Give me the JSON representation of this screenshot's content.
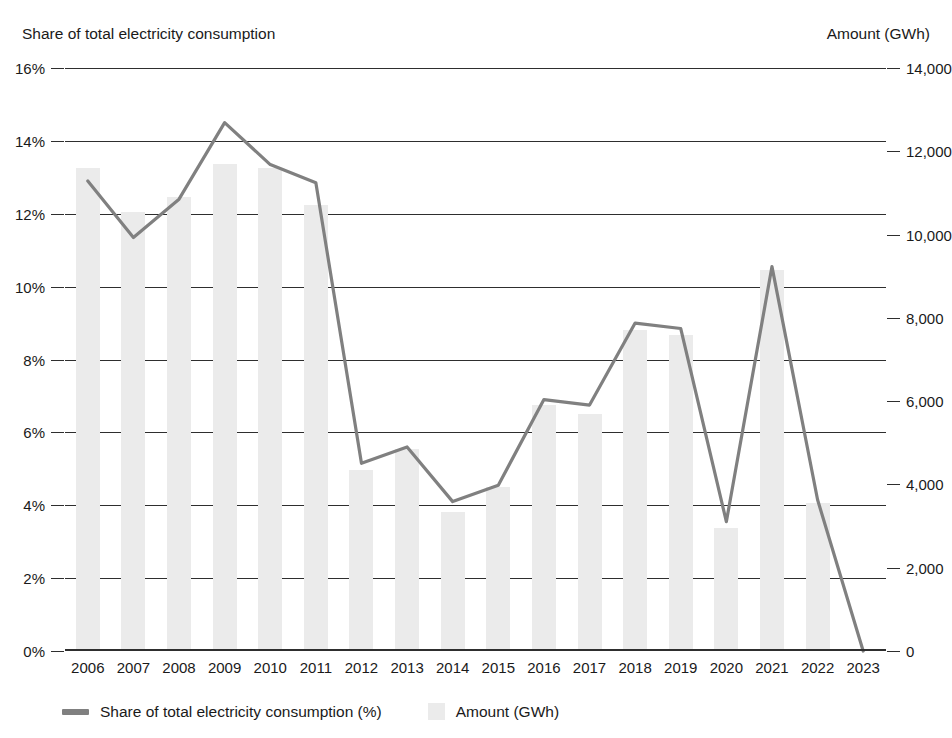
{
  "chart_data": {
    "type": "bar",
    "title": "",
    "subtitle": "",
    "categories": [
      "2006",
      "2007",
      "2008",
      "2009",
      "2010",
      "2011",
      "2012",
      "2013",
      "2014",
      "2015",
      "2016",
      "2017",
      "2018",
      "2019",
      "2020",
      "2021",
      "2022",
      "2023"
    ],
    "series": [
      {
        "name": "Amount (GWh)",
        "type": "bar",
        "axis": "right",
        "color": "#ebebeb",
        "values": [
          11600,
          10550,
          10900,
          11700,
          11600,
          10700,
          4350,
          4850,
          3350,
          3950,
          5900,
          5700,
          7700,
          7600,
          2950,
          9150,
          3550,
          0
        ]
      },
      {
        "name": "Share of total electricity consumption (%)",
        "type": "line",
        "axis": "left",
        "color": "#808080",
        "values": [
          12.9,
          11.35,
          12.4,
          14.5,
          13.35,
          12.85,
          5.15,
          5.6,
          4.1,
          4.55,
          6.9,
          6.75,
          9.0,
          8.85,
          3.55,
          10.55,
          4.15,
          0.0
        ]
      }
    ],
    "left_axis": {
      "label": "Share of total electricity consumption",
      "ticks": [
        "0%",
        "2%",
        "4%",
        "6%",
        "8%",
        "10%",
        "12%",
        "14%",
        "16%"
      ],
      "tick_values": [
        0,
        2,
        4,
        6,
        8,
        10,
        12,
        14,
        16
      ],
      "min": 0,
      "max": 16
    },
    "right_axis": {
      "label": "Amount (GWh)",
      "ticks": [
        "0",
        "2,000",
        "4,000",
        "6,000",
        "8,000",
        "10,000",
        "12,000",
        "14,000"
      ],
      "tick_values": [
        0,
        2000,
        4000,
        6000,
        8000,
        10000,
        12000,
        14000
      ],
      "min": 0,
      "max": 14000
    },
    "xlabel": "",
    "grid": true,
    "legend_position": "bottom-left"
  },
  "legend": {
    "items": [
      {
        "label": "Share of total electricity consumption (%)",
        "marker": "line",
        "color": "#808080"
      },
      {
        "label": "Amount (GWh)",
        "marker": "swatch",
        "color": "#ebebeb"
      }
    ]
  },
  "captions": {
    "left": "Share of total electricity consumption",
    "right": "Amount (GWh)"
  }
}
